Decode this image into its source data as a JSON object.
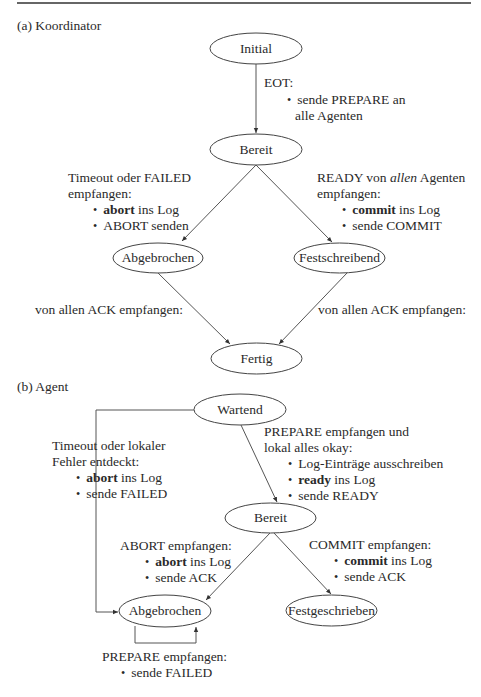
{
  "sections": {
    "a": {
      "label": "(a) Koordinator"
    },
    "b": {
      "label": "(b) Agent"
    }
  },
  "koordinator": {
    "states": {
      "initial": "Initial",
      "bereit": "Bereit",
      "abgebrochen": "Abgebrochen",
      "festschreibend": "Festschreibend",
      "fertig": "Fertig"
    },
    "transitions": {
      "eot": {
        "condition": "EOT:",
        "actions": [
          "sende PREPARE an",
          "alle Agenten"
        ]
      },
      "timeout": {
        "condition_line1": "Timeout oder FAILED",
        "condition_line2": "empfangen:",
        "action1_bold": "abort",
        "action1_rest": " ins Log",
        "action2": "ABORT senden"
      },
      "ready": {
        "condition_pre": "READY von ",
        "condition_italic": "allen",
        "condition_post": " Agenten",
        "condition_line2": "empfangen:",
        "action1_bold": "commit",
        "action1_rest": " ins Log",
        "action2": "sende COMMIT"
      },
      "ack_left": "von allen ACK empfangen:",
      "ack_right": "von allen ACK empfangen:"
    }
  },
  "agent": {
    "states": {
      "wartend": "Wartend",
      "bereit": "Bereit",
      "abgebrochen": "Abgebrochen",
      "festgeschrieben": "Festgeschrieben"
    },
    "transitions": {
      "timeout": {
        "condition_line1": "Timeout oder lokaler",
        "condition_line2": "Fehler entdeckt:",
        "action1_bold": "abort",
        "action1_rest": " ins Log",
        "action2": "sende FAILED"
      },
      "prepare_ok": {
        "condition_line1": "PREPARE empfangen und",
        "condition_line2": "lokal alles okay:",
        "action1": "Log-Einträge ausschreiben",
        "action2_bold": "ready",
        "action2_rest": " ins Log",
        "action3": "sende READY"
      },
      "abort": {
        "condition": "ABORT empfangen:",
        "action1_bold": "abort",
        "action1_rest": " ins Log",
        "action2": "sende ACK"
      },
      "commit": {
        "condition": "COMMIT empfangen:",
        "action1_bold": "commit",
        "action1_rest": " ins Log",
        "action2": "sende ACK"
      },
      "prepare_loop": {
        "condition": "PREPARE empfangen:",
        "action": "sende FAILED"
      }
    }
  }
}
